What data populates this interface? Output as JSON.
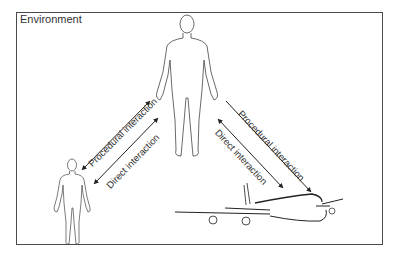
{
  "environment": {
    "label": "Environment"
  },
  "actors": [
    {
      "id": "human-large",
      "kind": "human-figure"
    },
    {
      "id": "human-small",
      "kind": "human-figure"
    },
    {
      "id": "aircraft",
      "kind": "airplane"
    }
  ],
  "interactions": {
    "left": {
      "procedural": "Procedural interaction",
      "direct": "Direct interaction"
    },
    "right": {
      "procedural": "Procedural interaction",
      "direct": "Direct interaction"
    }
  },
  "colors": {
    "stroke": "#333333",
    "frame": "#4a4a4a",
    "text": "#333333"
  }
}
